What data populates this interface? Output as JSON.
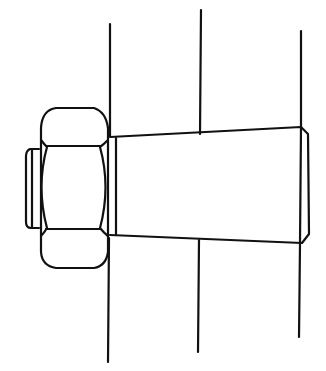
{
  "diagram": {
    "stroke_color": "#111111",
    "background_color": "#ffffff",
    "elements": [
      {
        "name": "vertical-line-left"
      },
      {
        "name": "vertical-line-middle"
      },
      {
        "name": "vertical-line-right"
      },
      {
        "name": "hex-nut"
      },
      {
        "name": "bolt-end-washer"
      },
      {
        "name": "tapered-bolt-shank"
      }
    ]
  }
}
